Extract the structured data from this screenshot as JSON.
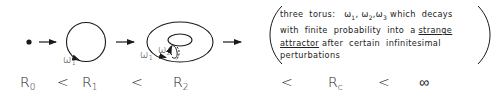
{
  "diagram": {
    "stages": [
      {
        "id": "fixed-point",
        "shape": "dot"
      },
      {
        "id": "limit-cycle",
        "shape": "circle",
        "frequencies": [
          "ω1"
        ]
      },
      {
        "id": "two-torus",
        "shape": "torus",
        "frequencies": [
          "ω1",
          "ω2"
        ]
      },
      {
        "id": "three-torus",
        "shape": "text-bracket"
      }
    ],
    "omega_labels": {
      "circle_w1": {
        "base": "ω",
        "sub": "1"
      },
      "torus_w1": {
        "base": "ω",
        "sub": "1"
      },
      "torus_w2": {
        "base": "ω",
        "sub": "2"
      }
    },
    "description": {
      "line1_a": "three torus:",
      "line1_w1": "ω",
      "line1_w1_sub": "1",
      "line1_w2": "ω",
      "line1_w2_sub": "2",
      "line1_w3": "ω",
      "line1_w3_sub": "3",
      "line1_b": "which decays",
      "line2_a": "with finite probability into a",
      "line2_ul": "strange",
      "line3_ul": "attractor",
      "line3_b": "after certain infinitesimal",
      "line4": "perturbations"
    },
    "sequence": [
      {
        "base": "R",
        "sub": "0"
      },
      {
        "op": "<"
      },
      {
        "base": "R",
        "sub": "1"
      },
      {
        "op": "<"
      },
      {
        "base": "R",
        "sub": "2"
      },
      {
        "op": "<"
      },
      {
        "base": "R",
        "sub": "c"
      },
      {
        "op": "<"
      },
      {
        "base": "∞"
      }
    ],
    "colors": {
      "ink": "#1a1a1a",
      "background": "#ffffff"
    }
  }
}
